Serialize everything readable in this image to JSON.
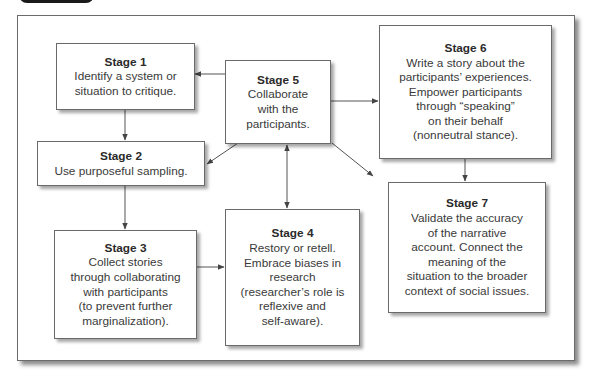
{
  "diagram": {
    "stages": [
      {
        "id": "stage1",
        "title": "Stage 1",
        "lines": [
          "Identify a system or",
          "situation to critique."
        ]
      },
      {
        "id": "stage2",
        "title": "Stage 2",
        "lines": [
          "Use purposeful sampling."
        ]
      },
      {
        "id": "stage3",
        "title": "Stage 3",
        "lines": [
          "Collect stories",
          "through collaborating",
          "with participants",
          "(to prevent further",
          "marginalization)."
        ]
      },
      {
        "id": "stage4",
        "title": "Stage 4",
        "lines": [
          "Restory or retell.",
          "Embrace biases in",
          "research",
          "(researcher’s role is",
          "reflexive and",
          "self-aware)."
        ]
      },
      {
        "id": "stage5",
        "title": "Stage 5",
        "lines": [
          "Collaborate",
          "with the",
          "participants."
        ]
      },
      {
        "id": "stage6",
        "title": "Stage 6",
        "lines": [
          "Write a story about the",
          "participants’ experiences.",
          "Empower participants",
          "through “speaking”",
          "on their behalf",
          "(nonneutral stance)."
        ]
      },
      {
        "id": "stage7",
        "title": "Stage 7",
        "lines": [
          "Validate the accuracy",
          "of the narrative",
          "account. Connect the",
          "meaning of the",
          "situation to the broader",
          "context of social issues."
        ]
      }
    ],
    "connections": [
      {
        "from": "Stage 1",
        "to": "Stage 2"
      },
      {
        "from": "Stage 2",
        "to": "Stage 3"
      },
      {
        "from": "Stage 3",
        "to": "Stage 4"
      },
      {
        "from": "Stage 5",
        "to": "Stage 1"
      },
      {
        "from": "Stage 5",
        "to": "Stage 2"
      },
      {
        "from": "Stage 5",
        "to": "Stage 4",
        "bidirectional": true
      },
      {
        "from": "Stage 5",
        "to": "Stage 6"
      },
      {
        "from": "Stage 5",
        "to": "Stage 7"
      },
      {
        "from": "Stage 6",
        "to": "Stage 7"
      }
    ],
    "colors": {
      "border": "#6a6a6a",
      "text": "#333333",
      "arrow": "#555555",
      "tab": "#1a1a1a"
    }
  }
}
